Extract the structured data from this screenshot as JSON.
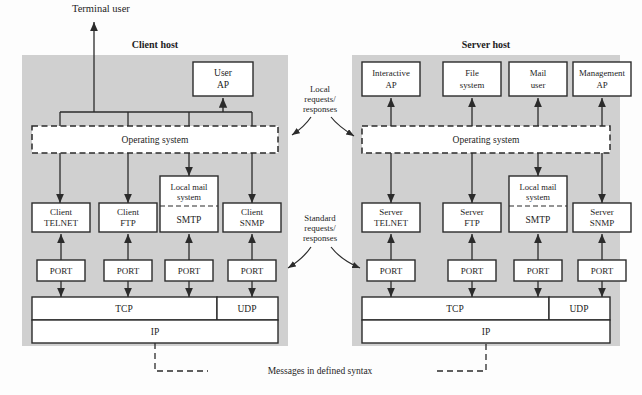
{
  "figure": {
    "type": "architecture-diagram",
    "title_terminal_user": "Terminal user",
    "bottom_label": "Messages in defined syntax"
  },
  "hosts": {
    "client": {
      "title": "Client host",
      "os_label": "Operating system",
      "apps": [
        {
          "line1": "User",
          "line2": "AP"
        }
      ],
      "protocols": [
        {
          "line1": "Client",
          "line2": "TELNET"
        },
        {
          "line1": "Client",
          "line2": "FTP"
        },
        {
          "line1": "Local mail",
          "line2": "system",
          "line3": "SMTP"
        },
        {
          "line1": "Client",
          "line2": "SNMP"
        }
      ],
      "ports": [
        "PORT",
        "PORT",
        "PORT",
        "PORT"
      ],
      "transport": [
        "TCP",
        "UDP"
      ],
      "network": "IP"
    },
    "server": {
      "title": "Server host",
      "os_label": "Operating system",
      "apps": [
        {
          "line1": "Interactive",
          "line2": "AP"
        },
        {
          "line1": "File",
          "line2": "system"
        },
        {
          "line1": "Mail",
          "line2": "user"
        },
        {
          "line1": "Management",
          "line2": "AP"
        }
      ],
      "protocols": [
        {
          "line1": "Server",
          "line2": "TELNET"
        },
        {
          "line1": "Server",
          "line2": "FTP"
        },
        {
          "line1": "Local mail",
          "line2": "system",
          "line3": "SMTP"
        },
        {
          "line1": "Server",
          "line2": "SNMP"
        }
      ],
      "ports": [
        "PORT",
        "PORT",
        "PORT",
        "PORT"
      ],
      "transport": [
        "TCP",
        "UDP"
      ],
      "network": "IP"
    }
  },
  "annotations": {
    "local": {
      "line1": "Local",
      "line2": "requests/",
      "line3": "responses"
    },
    "standard": {
      "line1": "Standard",
      "line2": "requests/",
      "line3": "responses"
    }
  },
  "colors": {
    "host_fill": "#d0d0d0",
    "box_fill": "#ffffff",
    "stroke": "#2b2b2b",
    "text": "#1d1d1d"
  }
}
